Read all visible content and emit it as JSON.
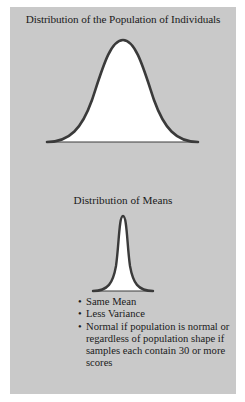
{
  "figure": {
    "background_color": "#c9c9c9",
    "curve_stroke_color": "#3a3a3a",
    "curve_fill_color": "#ffffff",
    "population": {
      "title": "Distribution of the Population of Individuals",
      "shape": "normal-wide"
    },
    "means": {
      "title": "Distribution of Means",
      "shape": "normal-narrow",
      "bullet_glyph": "•",
      "bullets": [
        "Same Mean",
        "Less Variance",
        "Normal if population is normal or regardless of population shape if samples each contain 30 or more scores"
      ]
    }
  }
}
